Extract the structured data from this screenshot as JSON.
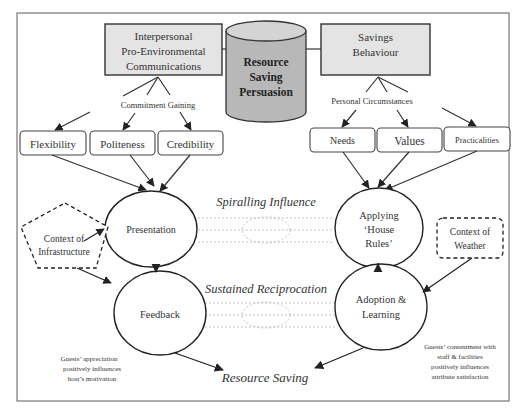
{
  "diagram": {
    "title": "Resource Saving Persuasion",
    "central": {
      "lines": [
        "Resource",
        "Saving",
        "Persuasion"
      ],
      "shape": "cylinder",
      "fill": "#b8b8b8"
    },
    "top_left_box": {
      "lines": [
        "Interpersonal",
        "Pro-Environmental",
        "Communications"
      ],
      "fill": "#e4e4e4"
    },
    "top_right_box": {
      "lines": [
        "Savings",
        "Behaviour"
      ],
      "fill": "#e4e4e4"
    },
    "left_branch_label": "Commitment Gaining",
    "right_branch_label": "Personal Circumstances",
    "left_factors": [
      "Flexibility",
      "Politeness",
      "Credibility"
    ],
    "right_factors": [
      "Needs",
      "Values",
      "Practicalities"
    ],
    "ellipses": {
      "presentation": "Presentation",
      "feedback": "Feedback",
      "applying": [
        "Applying",
        "‘House",
        "Rules’"
      ],
      "adoption": [
        "Adoption &",
        "Learning"
      ]
    },
    "links": {
      "upper": "Spiralling Influence",
      "lower": "Sustained Reciprocation"
    },
    "contexts": {
      "infrastructure": [
        "Context of",
        "Infrastructure"
      ],
      "weather": [
        "Context of",
        "Weather"
      ]
    },
    "outcome": "Resource Saving",
    "notes": {
      "left": [
        "Guests’ appreciation",
        "positively influences",
        "host’s motivation"
      ],
      "right": [
        "Guests’ contentment with",
        "staff &  facilities",
        "positively influences",
        "attribute satisfaction"
      ]
    }
  }
}
